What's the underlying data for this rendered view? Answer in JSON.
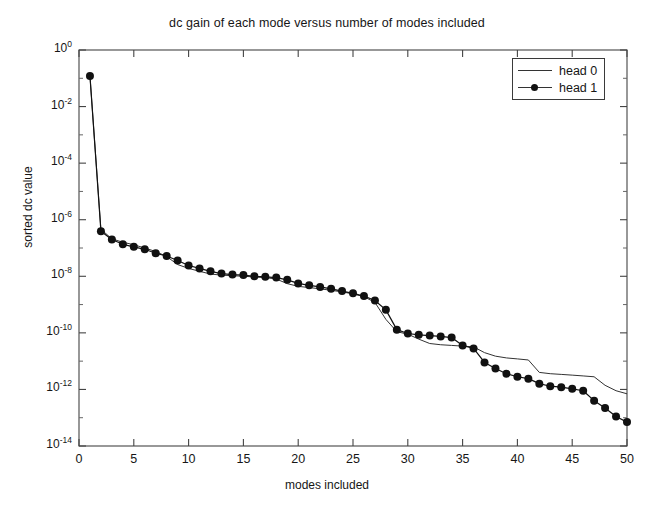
{
  "chart_data": {
    "type": "line",
    "title": "dc gain of each mode versus number of modes included",
    "xlabel": "modes included",
    "ylabel": "sorted dc value",
    "yscale": "log",
    "xlim": [
      0,
      50
    ],
    "ylim": [
      1e-14,
      1
    ],
    "grid": false,
    "legend_position": "top-right",
    "xticks": [
      0,
      5,
      10,
      15,
      20,
      25,
      30,
      35,
      40,
      45,
      50
    ],
    "xtick_labels": [
      "0",
      "5",
      "10",
      "15",
      "20",
      "25",
      "30",
      "35",
      "40",
      "45",
      "50"
    ],
    "yticks": [
      1,
      0.01,
      0.0001,
      1e-06,
      1e-08,
      1e-10,
      1e-12,
      1e-14
    ],
    "ytick_labels": [
      "10^0",
      "10^-2",
      "10^-4",
      "10^-6",
      "10^-8",
      "10^-10",
      "10^-12",
      "10^-14"
    ],
    "ytick_exponents": [
      "0",
      "-2",
      "-4",
      "-6",
      "-8",
      "-10",
      "-12",
      "-14"
    ],
    "x": [
      1,
      2,
      3,
      4,
      5,
      6,
      7,
      8,
      9,
      10,
      11,
      12,
      13,
      14,
      15,
      16,
      17,
      18,
      19,
      20,
      21,
      22,
      23,
      24,
      25,
      26,
      27,
      28,
      29,
      30,
      31,
      32,
      33,
      34,
      35,
      36,
      37,
      38,
      39,
      40,
      41,
      42,
      43,
      44,
      45,
      46,
      47,
      48,
      49,
      50
    ],
    "series": [
      {
        "name": "head 0",
        "marker": "none",
        "linestyle": "solid",
        "color": "#333333",
        "values": [
          0.12,
          4.6e-07,
          2.1e-07,
          1.6e-07,
          1.3e-07,
          1e-07,
          7.5e-08,
          5e-08,
          2.6e-08,
          1.9e-08,
          1.5e-08,
          1.2e-08,
          1.1e-08,
          1.05e-08,
          1e-08,
          9.5e-09,
          9e-09,
          8e-09,
          5.5e-09,
          4.4e-09,
          4e-09,
          3.6e-09,
          3.2e-09,
          2.8e-09,
          2.4e-09,
          1.9e-09,
          1.2e-09,
          3e-10,
          1.1e-10,
          9e-11,
          6e-11,
          4.2e-11,
          3.8e-11,
          3.6e-11,
          3.4e-11,
          3.2e-11,
          2e-11,
          1.5e-11,
          1.3e-11,
          1.2e-11,
          1.1e-11,
          4e-12,
          3.6e-12,
          3.4e-12,
          3.2e-12,
          3e-12,
          2.8e-12,
          1.4e-12,
          9e-13,
          7e-13
        ]
      },
      {
        "name": "head 1",
        "marker": "circle",
        "linestyle": "solid",
        "color": "#111111",
        "values": [
          0.12,
          3.9e-07,
          2e-07,
          1.35e-07,
          1.1e-07,
          9e-08,
          6.5e-08,
          5.2e-08,
          3.6e-08,
          2.4e-08,
          1.9e-08,
          1.5e-08,
          1.25e-08,
          1.15e-08,
          1.1e-08,
          1e-08,
          9.6e-09,
          9e-09,
          7.5e-09,
          5.6e-09,
          4.8e-09,
          4.2e-09,
          3.6e-09,
          3e-09,
          2.5e-09,
          2e-09,
          1.4e-09,
          6.5e-10,
          1.3e-10,
          9.5e-11,
          8.5e-11,
          8e-11,
          7.5e-11,
          6.8e-11,
          3.6e-11,
          2.8e-11,
          9e-12,
          5.5e-12,
          3.6e-12,
          2.8e-12,
          2.4e-12,
          1.6e-12,
          1.3e-12,
          1.2e-12,
          1.05e-12,
          9e-13,
          4e-13,
          2.2e-13,
          1.1e-13,
          7e-14
        ]
      }
    ]
  },
  "legend": {
    "entries": [
      {
        "label": "head 0"
      },
      {
        "label": "head 1"
      }
    ]
  }
}
